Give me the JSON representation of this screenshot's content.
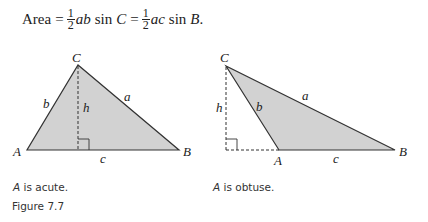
{
  "formula": {
    "lhs": "Area",
    "eq": "=",
    "frac_num": "1",
    "frac_den": "2",
    "term1": "ab",
    "sin1": "sin",
    "angle1": "C",
    "term2": "ac",
    "sin2": "sin",
    "angle2": "B",
    "end": "."
  },
  "figures": [
    {
      "id": "acute",
      "vertices": {
        "A": "A",
        "B": "B",
        "C": "C"
      },
      "sides": {
        "a": "a",
        "b": "b",
        "c": "c"
      },
      "height": "h",
      "caption_var": "A",
      "caption_text": " is acute."
    },
    {
      "id": "obtuse",
      "vertices": {
        "A": "A",
        "B": "B",
        "C": "C"
      },
      "sides": {
        "a": "a",
        "b": "b",
        "c": "c"
      },
      "height": "h",
      "caption_var": "A",
      "caption_text": " is obtuse."
    }
  ],
  "figure_title": "Figure 7.7",
  "colors": {
    "fill": "#d2d2d2",
    "stroke": "#333333"
  }
}
